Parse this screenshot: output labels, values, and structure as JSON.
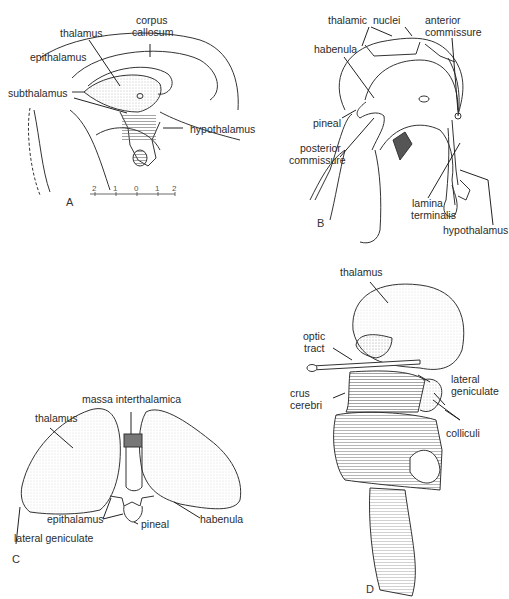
{
  "figure": {
    "panels": [
      {
        "id": "A",
        "letter": "A",
        "labels": {
          "corpus_callosum_1": "corpus",
          "corpus_callosum_2": "callosum",
          "thalamus": "thalamus",
          "epithalamus": "epithalamus",
          "subthalamus": "subthalamus",
          "hypothalamus": "hypothalamus"
        },
        "scale_ticks": [
          "2",
          "1",
          "0",
          "1",
          "2"
        ]
      },
      {
        "id": "B",
        "letter": "B",
        "labels": {
          "thalamic_nuclei": "thalamic  nuclei",
          "anterior_commissure_1": "anterior",
          "anterior_commissure_2": "commissure",
          "habenula": "habenula",
          "pineal": "pineal",
          "posterior_commissure_1": "posterior",
          "posterior_commissure_2": "commissure",
          "lamina_terminalis_1": "lamina",
          "lamina_terminalis_2": "terminalis",
          "hypothalamus": "hypothalamus"
        }
      },
      {
        "id": "C",
        "letter": "C",
        "labels": {
          "massa_interthalamica": "massa interthalamica",
          "thalamus": "thalamus",
          "epithalamus": "epithalamus",
          "pineal": "pineal",
          "habenula": "habenula",
          "lateral_geniculate": "lateral geniculate"
        }
      },
      {
        "id": "D",
        "letter": "D",
        "labels": {
          "thalamus": "thalamus",
          "optic_tract_1": "optic",
          "optic_tract_2": "tract",
          "crus_cerebri_1": "crus",
          "crus_cerebri_2": "cerebri",
          "lateral_geniculate_1": "lateral",
          "lateral_geniculate_2": "geniculate",
          "colliculi": "colliculi"
        }
      }
    ]
  },
  "colors": {
    "ink": "#2b2b2b",
    "shade": "#bdbdbd",
    "background": "#ffffff"
  }
}
